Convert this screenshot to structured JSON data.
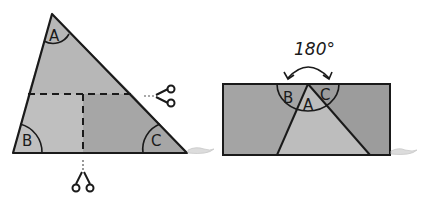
{
  "diagram": {
    "left_figure": {
      "shape": "triangle",
      "angles": [
        {
          "label": "A"
        },
        {
          "label": "B"
        },
        {
          "label": "C"
        }
      ],
      "cut_lines": [
        "horizontal-dashed",
        "vertical-dashed"
      ],
      "scissors": [
        "right-of-horizontal-cut",
        "below-vertical-cut"
      ]
    },
    "right_figure": {
      "shape": "rectangle",
      "angles": [
        {
          "label": "B"
        },
        {
          "label": "A"
        },
        {
          "label": "C"
        }
      ],
      "sum_label": "180°"
    },
    "colors": {
      "outline": "#1a1a1a",
      "fill_light": "#bdbdbd",
      "fill_mid": "#a9a9a9",
      "fill_dark": "#9a9a9a",
      "background": "#ffffff"
    }
  }
}
